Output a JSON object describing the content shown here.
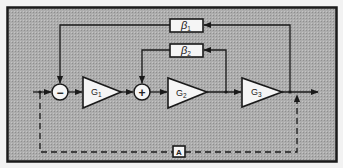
{
  "diagram": {
    "type": "feedback-loop-block-diagram",
    "background_color": "#a9a9a9",
    "frame_color": "#1a1a1a",
    "block_fill": "#f5f5f5",
    "line_color": "#1a1a1a",
    "summing_junctions": [
      {
        "id": "sum1",
        "sign": "−"
      },
      {
        "id": "sum2",
        "sign": "+"
      }
    ],
    "gain_blocks": [
      {
        "id": "G1",
        "label": "G",
        "subscript": "1"
      },
      {
        "id": "G2",
        "label": "G",
        "subscript": "2"
      },
      {
        "id": "G3",
        "label": "G",
        "subscript": "3"
      }
    ],
    "feedback_blocks": [
      {
        "id": "beta1",
        "label": "β",
        "subscript": "1"
      },
      {
        "id": "beta2",
        "label": "β",
        "subscript": "2"
      }
    ],
    "feedforward_block": {
      "id": "A",
      "label": "A"
    },
    "connections": [
      {
        "from": "input",
        "to": "sum1",
        "style": "solid"
      },
      {
        "from": "sum1",
        "to": "G1",
        "style": "solid"
      },
      {
        "from": "G1",
        "to": "sum2",
        "style": "solid"
      },
      {
        "from": "sum2",
        "to": "G2",
        "style": "solid"
      },
      {
        "from": "G2",
        "to": "G3",
        "style": "solid"
      },
      {
        "from": "G3",
        "to": "output",
        "style": "solid"
      },
      {
        "from": "output",
        "to": "beta1",
        "style": "solid"
      },
      {
        "from": "beta1",
        "to": "sum1",
        "style": "solid"
      },
      {
        "from": "G2",
        "to": "beta2",
        "style": "solid"
      },
      {
        "from": "beta2",
        "to": "sum2",
        "style": "solid"
      },
      {
        "from": "input",
        "to": "A",
        "style": "dashed"
      },
      {
        "from": "A",
        "to": "output",
        "style": "dashed"
      }
    ]
  }
}
